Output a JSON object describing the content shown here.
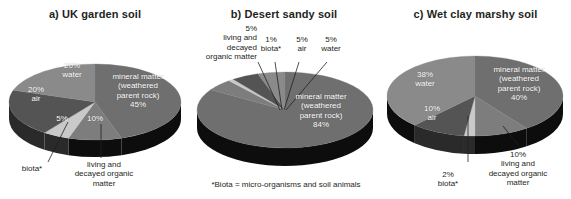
{
  "figure": {
    "footnote": "*Biota = micro-organisms and soil animals",
    "colors": {
      "mineral": "#6f6f6f",
      "organic": "#7d7d7d",
      "biota": "#c9c9c9",
      "air": "#545454",
      "water": "#8a8a8a",
      "side_dark": "#0d0d0d",
      "side_mid": "#2a2a2a",
      "leader": "#231f20",
      "label_text": "#ffffff",
      "outside_text": "#231f20"
    }
  },
  "chart_data": [
    {
      "type": "pie",
      "id": "uk-garden-soil",
      "title": "a) UK garden soil",
      "categories": [
        "mineral matter (weathered parent rock)",
        "living and decayed organic matter",
        "biota*",
        "air",
        "water"
      ],
      "values": [
        45,
        10,
        5,
        20,
        20
      ],
      "labels_inside": [
        {
          "text": "mineral matter\n(weathered\nparent rock)\n45%",
          "value": 45
        },
        {
          "text": "10%",
          "value": 10
        },
        {
          "text": "5%",
          "value": 5
        },
        {
          "text": "20%\nair",
          "value": 20
        },
        {
          "text": "20%\nwater",
          "value": 20
        }
      ],
      "labels_outside": [
        {
          "text": "biota*"
        },
        {
          "text": "living and\ndecayed organic\nmatter"
        }
      ]
    },
    {
      "type": "pie",
      "id": "desert-sandy-soil",
      "title": "b) Desert sandy soil",
      "categories": [
        "mineral matter (weathered parent rock)",
        "living and decayed organic matter",
        "biota*",
        "air",
        "water"
      ],
      "values": [
        84,
        5,
        1,
        5,
        5
      ],
      "labels_inside": [
        {
          "text": "mineral matter\n(weathered\nparent rock)\n84%",
          "value": 84
        }
      ],
      "labels_outside": [
        {
          "text": "5%\nliving and\ndecayed\norganic matter"
        },
        {
          "text": "1%\nbiota*"
        },
        {
          "text": "5%\nair"
        },
        {
          "text": "5%\nwater"
        }
      ]
    },
    {
      "type": "pie",
      "id": "wet-clay-marshy-soil",
      "title": "c) Wet clay marshy soil",
      "categories": [
        "mineral matter (weathered parent rock)",
        "living and decayed organic matter",
        "biota*",
        "air",
        "water"
      ],
      "values": [
        40,
        10,
        2,
        10,
        38
      ],
      "labels_inside": [
        {
          "text": "mineral matter\n(weathered\nparent rock)\n40%",
          "value": 40
        },
        {
          "text": "10%\nair",
          "value": 10
        },
        {
          "text": "38%\nwater",
          "value": 38
        }
      ],
      "labels_outside": [
        {
          "text": "2%\nbiota*"
        },
        {
          "text": "10%\nliving and\ndecayed organic\nmatter"
        }
      ]
    }
  ],
  "panels": {
    "a": {
      "title": "a) UK garden soil",
      "inside": {
        "mineral": "mineral matter\n(weathered\nparent rock)\n45%",
        "organic": "10%",
        "biota": "5%",
        "air": "20%\nair",
        "water": "20%\nwater"
      },
      "outside": {
        "biota": "biota*",
        "organic": "living and\ndecayed organic\nmatter"
      }
    },
    "b": {
      "title": "b) Desert sandy soil",
      "inside": {
        "mineral": "mineral matter\n(weathered\nparent rock)\n84%"
      },
      "outside": {
        "organic": "5%\nliving and\ndecayed\norganic matter",
        "biota": "1%\nbiota*",
        "air": "5%\nair",
        "water": "5%\nwater"
      }
    },
    "c": {
      "title": "c) Wet clay marshy soil",
      "inside": {
        "mineral": "mineral matter\n(weathered\nparent rock)\n40%",
        "air": "10%\nair",
        "water": "38%\nwater"
      },
      "outside": {
        "biota": "2%\nbiota*",
        "organic": "10%\nliving and\ndecayed organic\nmatter"
      }
    }
  }
}
